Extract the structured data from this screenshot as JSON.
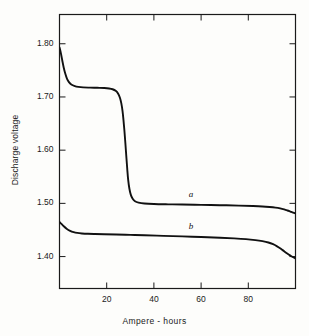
{
  "chart_data": {
    "type": "line",
    "title": "",
    "xlabel": "Ampere - hours",
    "ylabel": "Discharge voltage",
    "xlim": [
      0,
      100
    ],
    "ylim": [
      1.34,
      1.855
    ],
    "grid": false,
    "legend": "inline-labels",
    "xticks": [
      20,
      40,
      60,
      80
    ],
    "xtick_labels": [
      "20",
      "40",
      "60",
      "80"
    ],
    "yticks": [
      1.4,
      1.5,
      1.6,
      1.7,
      1.8
    ],
    "ytick_labels": [
      "1.40",
      "1.50",
      "1.60",
      "1.70",
      "1.80"
    ],
    "series": [
      {
        "name": "a",
        "label": "a",
        "color": "#111111",
        "x": [
          0,
          0.6,
          1.2,
          1.8,
          2.5,
          3.2,
          4.0,
          5.0,
          6.5,
          8.0,
          10,
          13,
          16,
          19,
          21,
          22.5,
          23.8,
          24.8,
          25.6,
          26.2,
          26.7,
          27.1,
          27.5,
          27.9,
          28.3,
          28.7,
          29.1,
          29.6,
          30.2,
          31.0,
          32.0,
          33.5,
          36,
          40,
          46,
          52,
          60,
          68,
          76,
          82,
          86,
          89,
          91.5,
          93.5,
          95.2,
          96.6,
          97.8,
          99,
          100
        ],
        "y": [
          1.793,
          1.782,
          1.768,
          1.755,
          1.743,
          1.734,
          1.728,
          1.7235,
          1.7205,
          1.719,
          1.718,
          1.7175,
          1.7172,
          1.7168,
          1.716,
          1.7145,
          1.7115,
          1.7065,
          1.6985,
          1.688,
          1.674,
          1.657,
          1.637,
          1.614,
          1.589,
          1.565,
          1.544,
          1.528,
          1.5165,
          1.5085,
          1.504,
          1.5015,
          1.4998,
          1.4988,
          1.4982,
          1.4978,
          1.4972,
          1.4966,
          1.4958,
          1.495,
          1.4942,
          1.4932,
          1.492,
          1.4905,
          1.4886,
          1.4866,
          1.4846,
          1.4826,
          1.4812
        ]
      },
      {
        "name": "b",
        "label": "b",
        "color": "#111111",
        "x": [
          0,
          0.8,
          1.8,
          3.0,
          4.5,
          6.0,
          7.5,
          9.5,
          12,
          15,
          19,
          24,
          30,
          36,
          44,
          52,
          60,
          68,
          74,
          79,
          83,
          86,
          88.5,
          90.5,
          92.2,
          93.8,
          95.2,
          96.5,
          97.7,
          98.8,
          100
        ],
        "y": [
          1.465,
          1.4615,
          1.457,
          1.4525,
          1.4485,
          1.446,
          1.4445,
          1.4435,
          1.4428,
          1.4424,
          1.442,
          1.4415,
          1.4408,
          1.44,
          1.439,
          1.438,
          1.4368,
          1.4354,
          1.4342,
          1.4328,
          1.431,
          1.429,
          1.4265,
          1.4232,
          1.4192,
          1.4146,
          1.41,
          1.4058,
          1.4022,
          1.3992,
          1.3968
        ]
      }
    ],
    "annotations": [
      {
        "text": "a",
        "x": 56,
        "y": 1.5135,
        "style": "italic"
      },
      {
        "text": "b",
        "x": 56,
        "y": 1.4545,
        "style": "italic"
      }
    ]
  }
}
